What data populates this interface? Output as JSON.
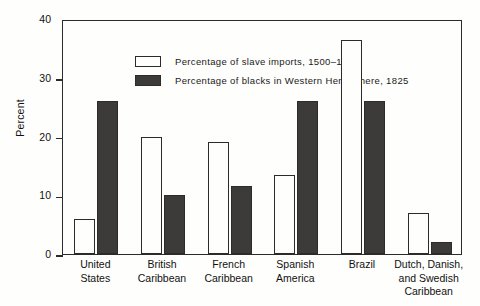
{
  "chart_data": {
    "type": "bar",
    "title": "",
    "xlabel": "",
    "ylabel": "Percent",
    "ylim": [
      0,
      40
    ],
    "yticks": [
      0,
      10,
      20,
      30,
      40
    ],
    "grid": false,
    "legend_position": "top-left",
    "categories": [
      "United States",
      "British Caribbean",
      "French Caribbean",
      "Spanish America",
      "Brazil",
      "Dutch, Danish, and Swedish Caribbean"
    ],
    "category_lines": [
      [
        "United",
        "States"
      ],
      [
        "British",
        "Caribbean"
      ],
      [
        "French",
        "Caribbean"
      ],
      [
        "Spanish",
        "America"
      ],
      [
        "Brazil"
      ],
      [
        "Dutch, Danish,",
        "and Swedish",
        "Caribbean"
      ]
    ],
    "series": [
      {
        "name": "Percentage of slave imports, 1500–1825",
        "style": "light",
        "color": "#fefefc",
        "values": [
          6,
          20,
          19,
          13.5,
          36.5,
          7
        ]
      },
      {
        "name": "Percentage of blacks in Western Hemisphere, 1825",
        "style": "dark",
        "color": "#3d3b39",
        "values": [
          26,
          10,
          11.5,
          26,
          26,
          2
        ]
      }
    ]
  },
  "axis": {
    "y_title": "Percent",
    "y_tick_labels": [
      "0",
      "10",
      "20",
      "30",
      "40"
    ]
  },
  "legend": {
    "items": [
      {
        "label": "Percentage of slave imports, 1500–1825",
        "style": "light"
      },
      {
        "label": "Percentage of blacks in Western Hemisphere, 1825",
        "style": "dark"
      }
    ]
  },
  "colors": {
    "bar_light": "#fefefc",
    "bar_dark": "#3d3b39",
    "frame": "#2b2b2b",
    "background": "#fefefc",
    "text": "#111111"
  }
}
